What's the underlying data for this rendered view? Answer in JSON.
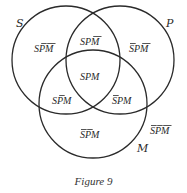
{
  "diagram": {
    "type": "venn",
    "sets": [
      {
        "id": "S",
        "label": "S",
        "cx": 66,
        "cy": 60,
        "r": 54,
        "label_x": 16,
        "label_y": 27
      },
      {
        "id": "P",
        "label": "P",
        "cx": 120,
        "cy": 60,
        "r": 54,
        "label_x": 166,
        "label_y": 27
      },
      {
        "id": "M",
        "label": "M",
        "cx": 93,
        "cy": 104,
        "r": 54,
        "label_x": 137,
        "label_y": 152
      }
    ],
    "regions": [
      {
        "name": "S-only",
        "text": "SPM",
        "bars": [
          false,
          true,
          true
        ],
        "x": 34,
        "y": 52
      },
      {
        "name": "S-and-P",
        "text": "SPM",
        "bars": [
          false,
          false,
          true
        ],
        "x": 80,
        "y": 45
      },
      {
        "name": "P-only",
        "text": "SPM",
        "bars": [
          true,
          false,
          true
        ],
        "x": 129,
        "y": 52
      },
      {
        "name": "S-P-M",
        "text": "SPM",
        "bars": [
          false,
          false,
          false
        ],
        "x": 80,
        "y": 80
      },
      {
        "name": "S-and-M",
        "text": "SPM",
        "bars": [
          false,
          true,
          false
        ],
        "x": 52,
        "y": 104
      },
      {
        "name": "P-and-M",
        "text": "SPM",
        "bars": [
          true,
          false,
          false
        ],
        "x": 112,
        "y": 104
      },
      {
        "name": "M-only",
        "text": "SPM",
        "bars": [
          true,
          true,
          false
        ],
        "x": 80,
        "y": 138
      },
      {
        "name": "outside",
        "text": "SPM",
        "bars": [
          true,
          true,
          true
        ],
        "x": 150,
        "y": 134
      }
    ],
    "caption": "Figure 9"
  }
}
